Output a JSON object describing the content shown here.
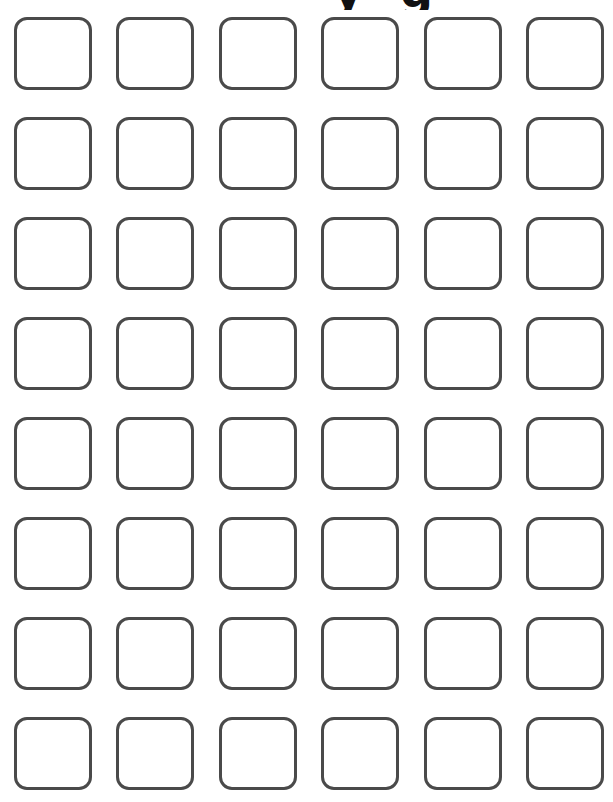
{
  "page": {
    "title_fragment_glyphs": [
      "y",
      "g"
    ],
    "stroke_color": "#4a4a4a",
    "background_color": "#ffffff"
  },
  "grid": {
    "rows": 8,
    "columns": 6,
    "column_x": [
      14,
      116,
      219,
      321,
      424,
      526
    ],
    "row_y": [
      17,
      117,
      217,
      317,
      417,
      517,
      617,
      717
    ],
    "box_count": 48
  }
}
